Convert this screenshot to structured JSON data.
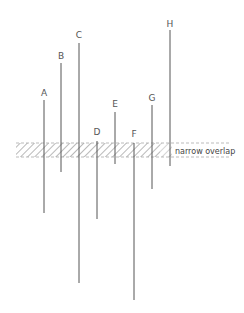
{
  "diagram": {
    "band": {
      "label": "narrow overlap",
      "x1": 16,
      "x2": 230,
      "y1": 143,
      "y2": 157,
      "hatch_color": "#9a9a9a",
      "border_color": "#aaaaaa"
    },
    "line_color": "#555555",
    "lines": [
      {
        "label": "A",
        "x": 44,
        "top": 100,
        "bottom": 213,
        "label_y": 96
      },
      {
        "label": "B",
        "x": 61,
        "top": 63,
        "bottom": 172,
        "label_y": 59
      },
      {
        "label": "C",
        "x": 79,
        "top": 43,
        "bottom": 283,
        "label_y": 38
      },
      {
        "label": "D",
        "x": 97,
        "top": 141,
        "bottom": 219,
        "label_y": 135
      },
      {
        "label": "E",
        "x": 115,
        "top": 112,
        "bottom": 164,
        "label_y": 107
      },
      {
        "label": "F",
        "x": 134,
        "top": 143,
        "bottom": 300,
        "label_y": 137
      },
      {
        "label": "G",
        "x": 152,
        "top": 105,
        "bottom": 189,
        "label_y": 101
      },
      {
        "label": "H",
        "x": 170,
        "top": 30,
        "bottom": 166,
        "label_y": 27
      }
    ]
  }
}
